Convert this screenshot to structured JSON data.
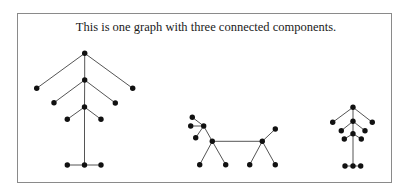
{
  "caption": "This is one graph with three connected components.",
  "colors": {
    "node": "#111111",
    "edge": "#555555",
    "border": "#8a8a8a"
  },
  "graph": {
    "components": [
      {
        "name": "left-tree",
        "nodes": [
          {
            "id": "a1",
            "x": 84.7,
            "y": 53.3
          },
          {
            "id": "a2",
            "x": 36.7,
            "y": 88.3
          },
          {
            "id": "a3",
            "x": 132.7,
            "y": 88.3
          },
          {
            "id": "a4",
            "x": 84.7,
            "y": 80
          },
          {
            "id": "a5",
            "x": 54,
            "y": 102.7
          },
          {
            "id": "a6",
            "x": 115.3,
            "y": 103
          },
          {
            "id": "a7",
            "x": 84.5,
            "y": 107
          },
          {
            "id": "a8",
            "x": 67.3,
            "y": 119.3
          },
          {
            "id": "a9",
            "x": 101,
            "y": 119.3
          },
          {
            "id": "a10",
            "x": 67.3,
            "y": 165
          },
          {
            "id": "a11",
            "x": 84.5,
            "y": 165
          },
          {
            "id": "a12",
            "x": 101,
            "y": 165
          }
        ],
        "edges": [
          [
            "a1",
            "a2"
          ],
          [
            "a1",
            "a3"
          ],
          [
            "a1",
            "a4"
          ],
          [
            "a4",
            "a5"
          ],
          [
            "a4",
            "a6"
          ],
          [
            "a4",
            "a7"
          ],
          [
            "a7",
            "a8"
          ],
          [
            "a7",
            "a9"
          ],
          [
            "a7",
            "a11"
          ],
          [
            "a10",
            "a11"
          ],
          [
            "a11",
            "a12"
          ]
        ]
      },
      {
        "name": "middle-graph",
        "nodes": [
          {
            "id": "b1",
            "x": 192.3,
            "y": 117.3
          },
          {
            "id": "b2",
            "x": 190.7,
            "y": 126
          },
          {
            "id": "b3",
            "x": 203.7,
            "y": 126
          },
          {
            "id": "b4",
            "x": 195.7,
            "y": 137.7
          },
          {
            "id": "b5",
            "x": 212.3,
            "y": 141.3
          },
          {
            "id": "b6",
            "x": 199.7,
            "y": 164.7
          },
          {
            "id": "b7",
            "x": 225.7,
            "y": 164.7
          },
          {
            "id": "b8",
            "x": 262.3,
            "y": 141.3
          },
          {
            "id": "b9",
            "x": 275.3,
            "y": 129
          },
          {
            "id": "b10",
            "x": 249.7,
            "y": 164.7
          },
          {
            "id": "b11",
            "x": 275.3,
            "y": 164.7
          }
        ],
        "edges": [
          [
            "b1",
            "b3"
          ],
          [
            "b2",
            "b3"
          ],
          [
            "b3",
            "b4"
          ],
          [
            "b3",
            "b5"
          ],
          [
            "b5",
            "b6"
          ],
          [
            "b5",
            "b7"
          ],
          [
            "b5",
            "b8"
          ],
          [
            "b8",
            "b9"
          ],
          [
            "b8",
            "b10"
          ],
          [
            "b8",
            "b11"
          ]
        ]
      },
      {
        "name": "right-tree",
        "nodes": [
          {
            "id": "c1",
            "x": 353,
            "y": 107.3
          },
          {
            "id": "c2",
            "x": 332.7,
            "y": 122.3
          },
          {
            "id": "c3",
            "x": 372.3,
            "y": 122.3
          },
          {
            "id": "c4",
            "x": 353,
            "y": 121.3
          },
          {
            "id": "c5",
            "x": 341.3,
            "y": 130.7
          },
          {
            "id": "c6",
            "x": 365,
            "y": 130.7
          },
          {
            "id": "c7",
            "x": 353,
            "y": 133.7
          },
          {
            "id": "c8",
            "x": 344.3,
            "y": 139
          },
          {
            "id": "c9",
            "x": 361.3,
            "y": 139
          },
          {
            "id": "c10",
            "x": 345,
            "y": 166
          },
          {
            "id": "c11",
            "x": 353,
            "y": 166
          },
          {
            "id": "c12",
            "x": 360.7,
            "y": 166
          }
        ],
        "edges": [
          [
            "c1",
            "c2"
          ],
          [
            "c1",
            "c3"
          ],
          [
            "c1",
            "c4"
          ],
          [
            "c4",
            "c5"
          ],
          [
            "c4",
            "c6"
          ],
          [
            "c4",
            "c7"
          ],
          [
            "c7",
            "c8"
          ],
          [
            "c7",
            "c9"
          ],
          [
            "c7",
            "c11"
          ],
          [
            "c10",
            "c11"
          ],
          [
            "c11",
            "c12"
          ]
        ]
      }
    ]
  }
}
